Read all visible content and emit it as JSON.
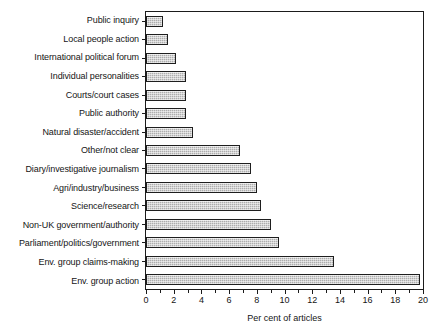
{
  "chart_data": {
    "type": "bar",
    "orientation": "horizontal",
    "title": "",
    "xlabel": "Per cent of articles",
    "ylabel": "",
    "xlim": [
      0,
      20
    ],
    "xticks": [
      0,
      2,
      4,
      6,
      8,
      10,
      12,
      14,
      16,
      18,
      20
    ],
    "xtick_labels": [
      "0",
      "2",
      "4",
      "6",
      "8",
      "10",
      "12",
      "14",
      "16",
      "18",
      "20"
    ],
    "grid": false,
    "legend": null,
    "categories": [
      "Public inquiry",
      "Local people action",
      "International political forum",
      "Individual personalities",
      "Courts/court cases",
      "Public authority",
      "Natural disaster/accident",
      "Other/not clear",
      "Diary/investigative journalism",
      "Agri/industry/business",
      "Science/research",
      "Non-UK government/authority",
      "Parliament/politics/government",
      "Env. group claims-making",
      "Env. group action"
    ],
    "values": [
      1.2,
      1.6,
      2.2,
      2.9,
      2.9,
      2.9,
      3.4,
      6.8,
      7.6,
      8.0,
      8.3,
      9.0,
      9.6,
      13.6,
      19.8
    ],
    "bar_fill_color": "#adadad",
    "bar_edge_color": "#1e1e1e",
    "axis_color": "#1b1b1b",
    "background_color": "#ffffff"
  }
}
